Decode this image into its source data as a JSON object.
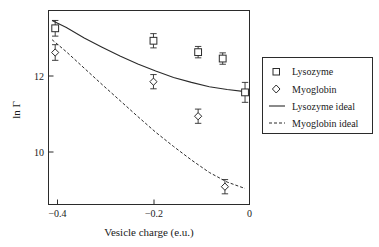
{
  "chart_data": {
    "type": "scatter",
    "title": "",
    "xlabel": "Vesicle charge (e.u.)",
    "ylabel": "ln Γ",
    "xlim": [
      -0.44,
      0.01
    ],
    "ylim": [
      8.45,
      13.9
    ],
    "xticks": [
      -0.4,
      -0.2,
      0
    ],
    "xtick_labels": [
      "−0.4",
      "−0.2",
      "0"
    ],
    "yticks": [
      10,
      12
    ],
    "ytick_labels": [
      "10",
      "12"
    ],
    "grid": false,
    "legend_position": "right-outside",
    "series": [
      {
        "name": "Lysozyme",
        "marker": "square",
        "type": "scatter",
        "x": [
          -0.425,
          -0.205,
          -0.105,
          -0.05,
          0.0
        ],
        "y": [
          13.4,
          13.05,
          12.73,
          12.55,
          11.6
        ],
        "yerr": [
          0.22,
          0.2,
          0.16,
          0.16,
          0.28
        ]
      },
      {
        "name": "Myoglobin",
        "marker": "diamond",
        "type": "scatter",
        "x": [
          -0.425,
          -0.205,
          -0.105,
          -0.045
        ],
        "y": [
          12.72,
          11.9,
          10.93,
          8.95
        ],
        "yerr": [
          0.22,
          0.2,
          0.2,
          0.2
        ]
      },
      {
        "name": "Lysozyme ideal",
        "marker": "line-solid",
        "type": "line",
        "x": [
          -0.432,
          -0.4,
          -0.36,
          -0.32,
          -0.28,
          -0.24,
          -0.2,
          -0.16,
          -0.12,
          -0.08,
          -0.04,
          0.0
        ],
        "y": [
          13.62,
          13.42,
          13.13,
          12.87,
          12.62,
          12.4,
          12.2,
          12.02,
          11.88,
          11.76,
          11.68,
          11.62
        ]
      },
      {
        "name": "Myoglobin ideal",
        "marker": "line-dashed",
        "type": "line",
        "x": [
          -0.432,
          -0.4,
          -0.36,
          -0.32,
          -0.28,
          -0.24,
          -0.2,
          -0.16,
          -0.12,
          -0.08,
          -0.04,
          0.0
        ],
        "y": [
          13.08,
          12.74,
          12.28,
          11.82,
          11.37,
          10.92,
          10.48,
          10.08,
          9.7,
          9.35,
          9.08,
          8.9
        ]
      }
    ],
    "legend_entries": [
      {
        "label": "Lysozyme",
        "symbol": "square"
      },
      {
        "label": "Myoglobin",
        "symbol": "diamond"
      },
      {
        "label": "Lysozyme ideal",
        "symbol": "line-solid"
      },
      {
        "label": "Myoglobin ideal",
        "symbol": "line-dashed"
      }
    ]
  },
  "colors": {
    "ink": "#2b2b2b",
    "background": "#ffffff"
  }
}
